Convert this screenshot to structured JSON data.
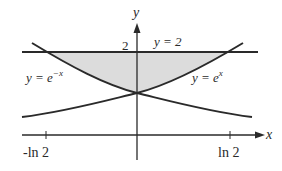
{
  "figure": {
    "type": "region-between-curves",
    "axes": {
      "x_label": "x",
      "y_label": "y",
      "x_ticks": [
        "-ln 2",
        "ln 2"
      ],
      "y_ticks": [
        "2"
      ]
    },
    "curves": [
      {
        "name": "exp-neg-x",
        "label_prefix": "y = e",
        "label_sup": "−x"
      },
      {
        "name": "exp-x",
        "label_prefix": "y = e",
        "label_sup": "x"
      },
      {
        "name": "horizontal-line",
        "label": "y = 2"
      }
    ],
    "shaded_region": {
      "color": "#dcdcdc",
      "description": "region between y=2 and max(e^x, e^-x)"
    },
    "colors": {
      "ink": "#2a2a2a",
      "shade": "#dcdcdc"
    }
  }
}
